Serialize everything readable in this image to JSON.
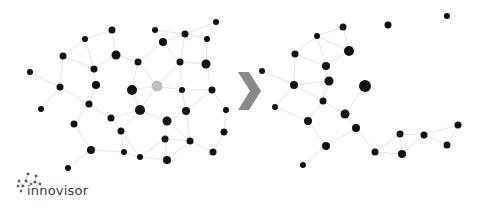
{
  "brand": {
    "name": "innovisor"
  },
  "arrow": {
    "icon": "chevron-right-icon",
    "color": "#8a8a8a"
  },
  "colors": {
    "node": "#111111",
    "highlight_node": "#bdbdbd",
    "edge": "#e6e6e6"
  },
  "diagram": {
    "before": {
      "label": "network-before",
      "nodes": [
        {
          "x": 216,
          "y": 22,
          "r": 3
        },
        {
          "x": 155,
          "y": 30,
          "r": 3
        },
        {
          "x": 112,
          "y": 30,
          "r": 3.5
        },
        {
          "x": 185,
          "y": 34,
          "r": 3.5
        },
        {
          "x": 85,
          "y": 39,
          "r": 3
        },
        {
          "x": 163,
          "y": 42,
          "r": 4
        },
        {
          "x": 207,
          "y": 39,
          "r": 3
        },
        {
          "x": 63,
          "y": 56,
          "r": 3.5
        },
        {
          "x": 116,
          "y": 55,
          "r": 4.5
        },
        {
          "x": 138,
          "y": 62,
          "r": 3.5
        },
        {
          "x": 180,
          "y": 62,
          "r": 3.5
        },
        {
          "x": 206,
          "y": 64,
          "r": 4.5
        },
        {
          "x": 94,
          "y": 69,
          "r": 3.5
        },
        {
          "x": 30,
          "y": 72,
          "r": 3
        },
        {
          "x": 60,
          "y": 87,
          "r": 3.5
        },
        {
          "x": 96,
          "y": 85,
          "r": 4
        },
        {
          "x": 132,
          "y": 90,
          "r": 5
        },
        {
          "x": 157,
          "y": 86,
          "r": 5.5,
          "highlight": true
        },
        {
          "x": 182,
          "y": 90,
          "r": 3
        },
        {
          "x": 212,
          "y": 90,
          "r": 3.5
        },
        {
          "x": 41,
          "y": 109,
          "r": 3
        },
        {
          "x": 89,
          "y": 104,
          "r": 3.5
        },
        {
          "x": 140,
          "y": 110,
          "r": 5
        },
        {
          "x": 186,
          "y": 111,
          "r": 4
        },
        {
          "x": 226,
          "y": 110,
          "r": 3
        },
        {
          "x": 111,
          "y": 118,
          "r": 3.5
        },
        {
          "x": 74,
          "y": 124,
          "r": 3.5
        },
        {
          "x": 167,
          "y": 121,
          "r": 4.5
        },
        {
          "x": 121,
          "y": 131,
          "r": 3.5
        },
        {
          "x": 165,
          "y": 139,
          "r": 3.5
        },
        {
          "x": 190,
          "y": 141,
          "r": 3.5
        },
        {
          "x": 224,
          "y": 132,
          "r": 3.5
        },
        {
          "x": 91,
          "y": 150,
          "r": 4
        },
        {
          "x": 124,
          "y": 152,
          "r": 3
        },
        {
          "x": 140,
          "y": 157,
          "r": 3
        },
        {
          "x": 167,
          "y": 160,
          "r": 4
        },
        {
          "x": 213,
          "y": 152,
          "r": 3.5
        },
        {
          "x": 68,
          "y": 168,
          "r": 3
        }
      ]
    },
    "after": {
      "label": "network-after",
      "nodes": [
        {
          "x": 447,
          "y": 16,
          "r": 3
        },
        {
          "x": 388,
          "y": 25,
          "r": 3.5
        },
        {
          "x": 343,
          "y": 27,
          "r": 3.5
        },
        {
          "x": 317,
          "y": 36,
          "r": 3
        },
        {
          "x": 295,
          "y": 54,
          "r": 3.5
        },
        {
          "x": 349,
          "y": 51,
          "r": 5
        },
        {
          "x": 326,
          "y": 66,
          "r": 4
        },
        {
          "x": 262,
          "y": 71,
          "r": 3
        },
        {
          "x": 294,
          "y": 85,
          "r": 4
        },
        {
          "x": 329,
          "y": 81,
          "r": 4.5
        },
        {
          "x": 365,
          "y": 86,
          "r": 6
        },
        {
          "x": 323,
          "y": 101,
          "r": 3.5
        },
        {
          "x": 275,
          "y": 107,
          "r": 3
        },
        {
          "x": 345,
          "y": 114,
          "r": 4.5
        },
        {
          "x": 308,
          "y": 121,
          "r": 4
        },
        {
          "x": 356,
          "y": 128,
          "r": 4
        },
        {
          "x": 400,
          "y": 134,
          "r": 3.5
        },
        {
          "x": 424,
          "y": 135,
          "r": 3.5
        },
        {
          "x": 458,
          "y": 125,
          "r": 3.5
        },
        {
          "x": 326,
          "y": 146,
          "r": 4
        },
        {
          "x": 447,
          "y": 145,
          "r": 3.5
        },
        {
          "x": 375,
          "y": 152,
          "r": 3.5
        },
        {
          "x": 402,
          "y": 154,
          "r": 4
        },
        {
          "x": 303,
          "y": 165,
          "r": 3
        }
      ]
    }
  }
}
